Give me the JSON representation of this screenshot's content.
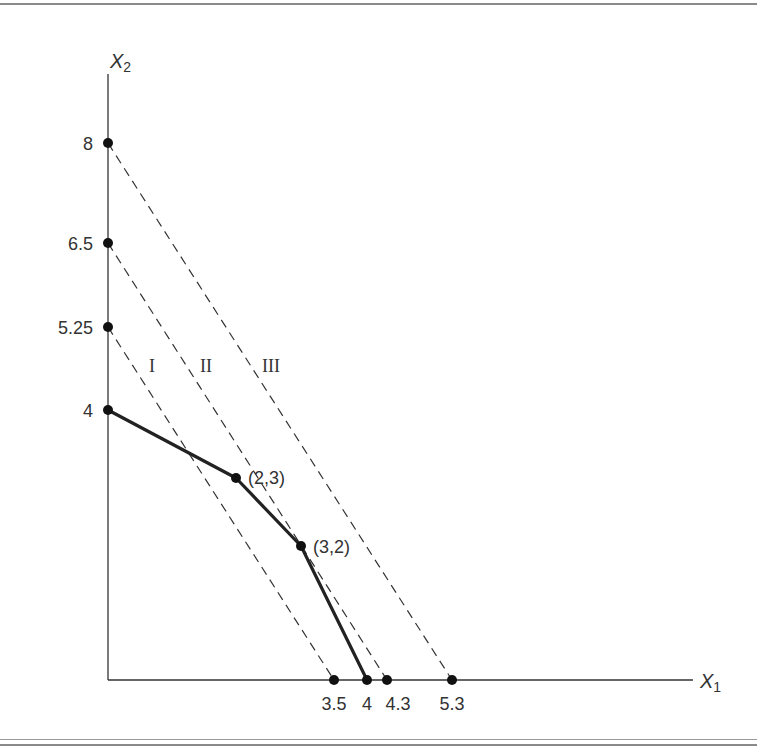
{
  "diagram": {
    "axes": {
      "x_label": "X",
      "x_label_sub": "1",
      "y_label": "X",
      "y_label_sub": "2"
    },
    "y_ticks": [
      {
        "label": "8",
        "value": 8
      },
      {
        "label": "6.5",
        "value": 6.5
      },
      {
        "label": "5.25",
        "value": 5.25
      },
      {
        "label": "4",
        "value": 4
      }
    ],
    "x_ticks": [
      {
        "label": "3.5",
        "value": 3.5
      },
      {
        "label": "4",
        "value": 4
      },
      {
        "label": "4.3",
        "value": 4.3
      },
      {
        "label": "5.3",
        "value": 5.3
      }
    ],
    "iso_lines": [
      {
        "label": "I",
        "from": [
          0,
          5.25
        ],
        "to": [
          3.5,
          0
        ],
        "style": "dashed"
      },
      {
        "label": "II",
        "from": [
          0,
          6.5
        ],
        "to": [
          4.3,
          0
        ],
        "style": "dashed"
      },
      {
        "label": "III",
        "from": [
          0,
          8
        ],
        "to": [
          5.3,
          0
        ],
        "style": "dashed"
      }
    ],
    "frontier": {
      "style": "solid-thick",
      "points": [
        [
          0,
          4
        ],
        [
          2,
          3
        ],
        [
          3,
          2
        ],
        [
          4,
          0
        ]
      ],
      "labels": [
        "(2,3)",
        "(3,2)"
      ]
    },
    "colors": {
      "line": "#333333",
      "frame": "#8a8a8a"
    }
  }
}
